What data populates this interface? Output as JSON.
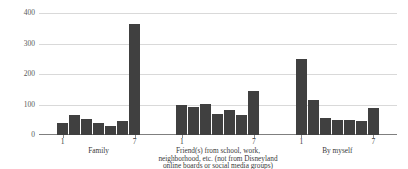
{
  "chart_data": {
    "type": "bar",
    "title": "",
    "subtitle": "",
    "xlabel": "",
    "ylabel": "",
    "ylim": [
      0,
      400
    ],
    "yticks": [
      0,
      100,
      200,
      300,
      400
    ],
    "grid": true,
    "legend": false,
    "bar_color": "#404040",
    "gridline_color": "#d9d9d9",
    "axis_color": "#7f7f7f",
    "x": [
      1,
      2,
      3,
      4,
      5,
      6,
      7
    ],
    "groups": [
      {
        "label_lines": [
          "Family"
        ],
        "tick_labels": [
          "1",
          "7"
        ],
        "categories": [
          "1",
          "2",
          "3",
          "4",
          "5",
          "6",
          "7"
        ],
        "values": [
          41,
          67,
          52,
          41,
          30,
          47,
          365
        ]
      },
      {
        "label_lines": [
          "Friend(s) from school, work,",
          "neighborhood, etc. (not from Disneyland",
          "online boards or social media groups)"
        ],
        "tick_labels": [
          "1",
          "7"
        ],
        "categories": [
          "1",
          "2",
          "3",
          "4",
          "5",
          "6",
          "7"
        ],
        "values": [
          100,
          92,
          103,
          70,
          83,
          65,
          145
        ]
      },
      {
        "label_lines": [
          "By myself"
        ],
        "tick_labels": [
          "1",
          "7"
        ],
        "categories": [
          "1",
          "2",
          "3",
          "4",
          "5",
          "6",
          "7"
        ],
        "values": [
          248,
          115,
          57,
          50,
          48,
          47,
          88
        ]
      }
    ]
  }
}
